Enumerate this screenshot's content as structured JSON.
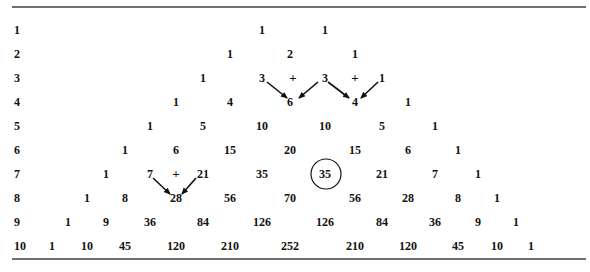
{
  "figure": {
    "row_labels": [
      "1",
      "2",
      "3",
      "4",
      "5",
      "6",
      "7",
      "8",
      "9",
      "10"
    ],
    "rows": [
      [
        "1",
        "1"
      ],
      [
        "1",
        "2",
        "1"
      ],
      [
        "1",
        "3",
        "3",
        "1"
      ],
      [
        "1",
        "4",
        "6",
        "4",
        "1"
      ],
      [
        "1",
        "5",
        "10",
        "10",
        "5",
        "1"
      ],
      [
        "1",
        "6",
        "15",
        "20",
        "15",
        "6",
        "1"
      ],
      [
        "1",
        "7",
        "21",
        "35",
        "35",
        "21",
        "7",
        "1"
      ],
      [
        "1",
        "8",
        "28",
        "56",
        "70",
        "56",
        "28",
        "8",
        "1"
      ],
      [
        "1",
        "9",
        "36",
        "84",
        "126",
        "126",
        "84",
        "36",
        "9",
        "1"
      ],
      [
        "1",
        "10",
        "45",
        "120",
        "210",
        "252",
        "210",
        "120",
        "45",
        "10",
        "1"
      ]
    ],
    "annotations": {
      "plus_sign": "+",
      "highlighted_value": "35",
      "highlighted_row": 7,
      "sum_examples": [
        {
          "row": 3,
          "addends": [
            "3",
            "3"
          ],
          "result_row": 4,
          "result": "6"
        },
        {
          "row": 3,
          "addends": [
            "3",
            "1"
          ],
          "result_row": 4,
          "result": "4"
        },
        {
          "row": 7,
          "addends": [
            "7",
            "21"
          ],
          "result_row": 8,
          "result": "28"
        }
      ]
    },
    "colors": {
      "text": "#111111",
      "rule": "#6e6e6e",
      "background": "#ffffff"
    }
  }
}
